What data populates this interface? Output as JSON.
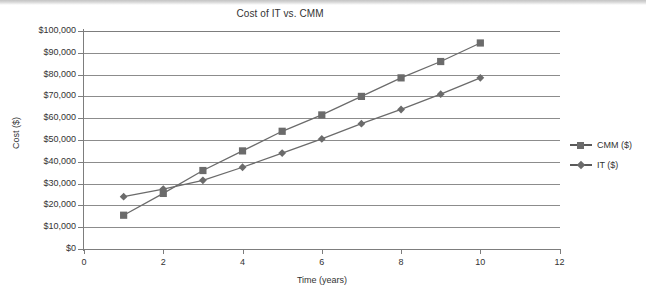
{
  "chart_data": {
    "type": "line",
    "title": "Cost of IT vs. CMM",
    "xlabel": "Time (years)",
    "ylabel": "Cost ($)",
    "x": [
      1,
      2,
      3,
      4,
      5,
      6,
      7,
      8,
      9,
      10
    ],
    "xlim": [
      0,
      12
    ],
    "ylim": [
      0,
      100000
    ],
    "xticks": [
      "0",
      "2",
      "4",
      "6",
      "8",
      "10",
      "12"
    ],
    "xtick_values": [
      0,
      2,
      4,
      6,
      8,
      10,
      12
    ],
    "yticks": [
      "$0",
      "$10,000",
      "$20,000",
      "$30,000",
      "$40,000",
      "$50,000",
      "$60,000",
      "$70,000",
      "$80,000",
      "$90,000",
      "$100,000"
    ],
    "ytick_values": [
      0,
      10000,
      20000,
      30000,
      40000,
      50000,
      60000,
      70000,
      80000,
      90000,
      100000
    ],
    "grid": "horizontal",
    "legend_position": "right",
    "series": [
      {
        "name": "CMM ($)",
        "marker": "square",
        "color": "#6b6b6b",
        "values": [
          15500,
          25500,
          36000,
          45000,
          54000,
          61500,
          70000,
          78500,
          86000,
          94500
        ]
      },
      {
        "name": "IT ($)",
        "marker": "diamond",
        "color": "#6b6b6b",
        "values": [
          24000,
          27500,
          31500,
          37500,
          44000,
          50500,
          57500,
          64000,
          71000,
          78500
        ]
      }
    ]
  }
}
